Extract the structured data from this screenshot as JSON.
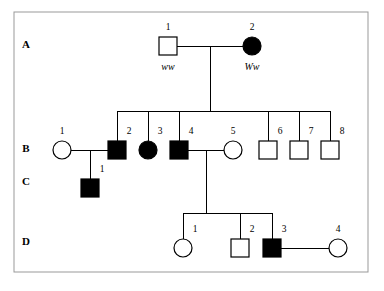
{
  "figure": {
    "type": "pedigree-chart",
    "background_color": "#ffffff",
    "frame_color": "#999999",
    "line_color": "#000000",
    "affected_fill": "#000000",
    "unaffected_fill": "#ffffff"
  },
  "generations": [
    {
      "id": "A",
      "label": "A",
      "label_x": 26,
      "label_y": 48
    },
    {
      "id": "B",
      "label": "B",
      "label_y": 152,
      "label_x": 26
    },
    {
      "id": "C",
      "label": "C",
      "label_x": 26,
      "label_y": 185
    },
    {
      "id": "D",
      "label": "D",
      "label_x": 26,
      "label_y": 245
    }
  ],
  "individuals": [
    {
      "id": "A1",
      "generation": "A",
      "number": "1",
      "shape": "square",
      "sex": "male",
      "affected": false,
      "cx": 168,
      "cy": 46,
      "num_x": 168,
      "num_y": 30,
      "genotype": "ww",
      "genotype_x": 168,
      "genotype_y": 70
    },
    {
      "id": "A2",
      "generation": "A",
      "number": "2",
      "shape": "circle",
      "sex": "female",
      "affected": true,
      "cx": 252,
      "cy": 46,
      "num_x": 252,
      "num_y": 30,
      "genotype": "Ww",
      "genotype_x": 252,
      "genotype_y": 70
    },
    {
      "id": "B1",
      "generation": "B",
      "number": "1",
      "shape": "circle",
      "sex": "female",
      "affected": false,
      "cx": 62,
      "cy": 150,
      "num_x": 62,
      "num_y": 134,
      "genotype": null
    },
    {
      "id": "B2",
      "generation": "B",
      "number": "2",
      "shape": "square",
      "sex": "male",
      "affected": true,
      "cx": 117,
      "cy": 150,
      "num_x": 129,
      "num_y": 134,
      "genotype": null
    },
    {
      "id": "B3",
      "generation": "B",
      "number": "3",
      "shape": "circle",
      "sex": "female",
      "affected": true,
      "cx": 148,
      "cy": 150,
      "num_x": 160,
      "num_y": 134,
      "genotype": null
    },
    {
      "id": "B4",
      "generation": "B",
      "number": "4",
      "shape": "square",
      "sex": "male",
      "affected": true,
      "cx": 179,
      "cy": 150,
      "num_x": 191,
      "num_y": 134,
      "genotype": null
    },
    {
      "id": "B5",
      "generation": "B",
      "number": "5",
      "shape": "circle",
      "sex": "female",
      "affected": false,
      "cx": 233,
      "cy": 150,
      "num_x": 233,
      "num_y": 134,
      "genotype": null
    },
    {
      "id": "B6",
      "generation": "B",
      "number": "6",
      "shape": "square",
      "sex": "male",
      "affected": false,
      "cx": 268,
      "cy": 150,
      "num_x": 280,
      "num_y": 134,
      "genotype": null
    },
    {
      "id": "B7",
      "generation": "B",
      "number": "7",
      "shape": "square",
      "sex": "male",
      "affected": false,
      "cx": 299,
      "cy": 150,
      "num_x": 311,
      "num_y": 134,
      "genotype": null
    },
    {
      "id": "B8",
      "generation": "B",
      "number": "8",
      "shape": "square",
      "sex": "male",
      "affected": false,
      "cx": 330,
      "cy": 150,
      "num_x": 342,
      "num_y": 134,
      "genotype": null
    },
    {
      "id": "C1",
      "generation": "C",
      "number": "1",
      "shape": "square",
      "sex": "male",
      "affected": true,
      "cx": 90,
      "cy": 188,
      "num_x": 102,
      "num_y": 172,
      "genotype": null
    },
    {
      "id": "D1",
      "generation": "D",
      "number": "1",
      "shape": "circle",
      "sex": "female",
      "affected": false,
      "cx": 183,
      "cy": 248,
      "num_x": 195,
      "num_y": 232,
      "genotype": null
    },
    {
      "id": "D2",
      "generation": "D",
      "number": "2",
      "shape": "square",
      "sex": "male",
      "affected": false,
      "cx": 240,
      "cy": 248,
      "num_x": 252,
      "num_y": 232,
      "genotype": null
    },
    {
      "id": "D3",
      "generation": "D",
      "number": "3",
      "shape": "square",
      "sex": "male",
      "affected": true,
      "cx": 272,
      "cy": 248,
      "num_x": 284,
      "num_y": 232,
      "genotype": null
    },
    {
      "id": "D4",
      "generation": "D",
      "number": "4",
      "shape": "circle",
      "sex": "female",
      "affected": false,
      "cx": 338,
      "cy": 248,
      "num_x": 338,
      "num_y": 232,
      "genotype": null
    }
  ],
  "matings": [
    {
      "id": "A1-A2",
      "partners": [
        "A1",
        "A2"
      ],
      "line": "M 177 46 L 243 46"
    },
    {
      "id": "B1-B2",
      "partners": [
        "B1",
        "B2"
      ],
      "line": "M 71 150 L 108 150"
    },
    {
      "id": "B4-B5",
      "partners": [
        "B4",
        "B5"
      ],
      "line": "M 188 150 L 224 150"
    },
    {
      "id": "D3-D4",
      "partners": [
        "D3",
        "D4"
      ],
      "line": "M 281 248 L 329 248"
    }
  ],
  "sibships": [
    {
      "id": "sibship-B",
      "parents": "A1-A2",
      "children": [
        "B2",
        "B3",
        "B4",
        "B6",
        "B7",
        "B8"
      ],
      "descent_line": "M 210 46 L 210 111",
      "sib_bar": "M 117 111 L 330 111",
      "drop_lines": [
        "M 117 111 L 117 141",
        "M 148 111 L 148 141",
        "M 179 111 L 179 141",
        "M 268 111 L 268 141",
        "M 299 111 L 299 141",
        "M 330 111 L 330 141"
      ]
    },
    {
      "id": "sibship-C",
      "parents": "B1-B2",
      "children": [
        "C1"
      ],
      "descent_line": "M 90 150 L 90 179",
      "sib_bar": null,
      "drop_lines": []
    },
    {
      "id": "sibship-D",
      "parents": "B4-B5",
      "children": [
        "D1",
        "D2",
        "D3"
      ],
      "descent_line": "M 206 150 L 206 213",
      "sib_bar": "M 183 213 L 272 213",
      "drop_lines": [
        "M 183 213 L 183 239",
        "M 240 213 L 240 239",
        "M 272 213 L 272 239"
      ]
    }
  ],
  "frame": {
    "x": 14,
    "y": 12,
    "width": 354,
    "height": 260
  },
  "geometry": {
    "square_size": 18,
    "circle_radius": 9
  }
}
